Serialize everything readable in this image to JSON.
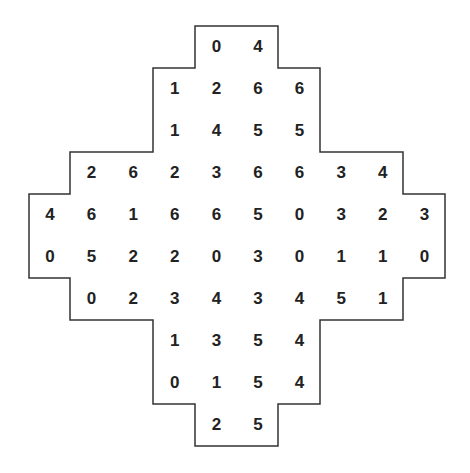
{
  "puzzle": {
    "type": "domino-grid",
    "outline_color": "#333333",
    "text_color": "#222222",
    "rows": [
      {
        "start_col": 4,
        "values": [
          "0",
          "4"
        ]
      },
      {
        "start_col": 3,
        "values": [
          "1",
          "2",
          "6",
          "6"
        ]
      },
      {
        "start_col": 3,
        "values": [
          "1",
          "4",
          "5",
          "5"
        ]
      },
      {
        "start_col": 1,
        "values": [
          "2",
          "6",
          "2",
          "3",
          "6",
          "6",
          "3",
          "4"
        ]
      },
      {
        "start_col": 0,
        "values": [
          "4",
          "6",
          "1",
          "6",
          "6",
          "5",
          "0",
          "3",
          "2",
          "3"
        ]
      },
      {
        "start_col": 0,
        "values": [
          "0",
          "5",
          "2",
          "2",
          "0",
          "3",
          "0",
          "1",
          "1",
          "0"
        ]
      },
      {
        "start_col": 1,
        "values": [
          "0",
          "2",
          "3",
          "4",
          "3",
          "4",
          "5",
          "1"
        ]
      },
      {
        "start_col": 3,
        "values": [
          "1",
          "3",
          "5",
          "4"
        ]
      },
      {
        "start_col": 3,
        "values": [
          "0",
          "1",
          "5",
          "4"
        ]
      },
      {
        "start_col": 4,
        "values": [
          "2",
          "5"
        ]
      }
    ]
  }
}
